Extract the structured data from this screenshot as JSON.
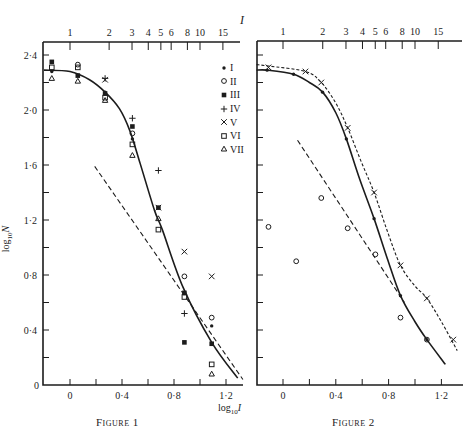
{
  "title": "I",
  "figures": [
    {
      "caption": "Figure 1",
      "ylabel_base": "log",
      "ylabel_sub": "10",
      "ylabel_var": "N"
    },
    {
      "caption": "Figure 2"
    }
  ],
  "xlabel": {
    "base": "log",
    "sub": "10",
    "var": "I"
  },
  "legend": [
    {
      "marker": "dot",
      "label": "I"
    },
    {
      "marker": "circle",
      "label": "II"
    },
    {
      "marker": "filled-square",
      "label": "III"
    },
    {
      "marker": "plus",
      "label": "IV"
    },
    {
      "marker": "cross",
      "label": "V"
    },
    {
      "marker": "open-square",
      "label": "VI"
    },
    {
      "marker": "triangle",
      "label": "VII"
    }
  ],
  "chart_data": [
    {
      "type": "scatter",
      "title": "Figure 1",
      "xlabel": "log10 I",
      "ylabel": "log10 N",
      "top_axis_label": "I",
      "xlim": [
        -0.2,
        1.33
      ],
      "ylim": [
        0,
        2.5
      ],
      "x_ticks": [
        0,
        0.2,
        0.4,
        0.6,
        0.8,
        1.0,
        1.2
      ],
      "x_tick_labels": [
        {
          "v": 0,
          "t": "0"
        },
        {
          "v": 0.4,
          "t": "0·4"
        },
        {
          "v": 0.8,
          "t": "0·8"
        },
        {
          "v": 1.2,
          "t": "1·2"
        }
      ],
      "y_ticks": [
        0.2,
        0.4,
        0.6,
        0.8,
        1.0,
        1.2,
        1.4,
        1.6,
        1.8,
        2.0,
        2.2,
        2.4
      ],
      "y_tick_labels": [
        {
          "v": 0,
          "t": "0"
        },
        {
          "v": 0.4,
          "t": "0·4"
        },
        {
          "v": 0.8,
          "t": "0·8"
        },
        {
          "v": 1.2,
          "t": "1·2"
        },
        {
          "v": 1.6,
          "t": "1·6"
        },
        {
          "v": 2.0,
          "t": "2·0"
        },
        {
          "v": 2.4,
          "t": "2·4"
        }
      ],
      "top_ticks": [
        1,
        2,
        3,
        4,
        5,
        6,
        8,
        10,
        15
      ],
      "grid": false,
      "legend_position": "upper right",
      "series": [
        {
          "name": "I",
          "marker": "dot",
          "points": [
            [
              -0.14,
              2.28
            ],
            [
              0.27,
              2.13
            ],
            [
              0.48,
              1.79
            ],
            [
              0.68,
              1.29
            ],
            [
              1.09,
              0.43
            ]
          ]
        },
        {
          "name": "II",
          "marker": "circle",
          "points": [
            [
              0.06,
              2.33
            ],
            [
              0.48,
              1.83
            ],
            [
              0.88,
              0.79
            ],
            [
              1.09,
              0.49
            ]
          ]
        },
        {
          "name": "III",
          "marker": "filled-square",
          "points": [
            [
              -0.14,
              2.35
            ],
            [
              0.06,
              2.25
            ],
            [
              0.27,
              2.12
            ],
            [
              0.48,
              1.88
            ],
            [
              0.68,
              1.29
            ],
            [
              0.88,
              0.67
            ],
            [
              0.88,
              0.31
            ],
            [
              1.09,
              0.3
            ]
          ]
        },
        {
          "name": "IV",
          "marker": "plus",
          "points": [
            [
              0.27,
              2.23
            ],
            [
              0.48,
              1.94
            ],
            [
              0.68,
              1.56
            ],
            [
              0.88,
              0.52
            ]
          ]
        },
        {
          "name": "V",
          "marker": "cross",
          "points": [
            [
              0.27,
              2.22
            ],
            [
              0.68,
              1.29
            ],
            [
              0.88,
              0.97
            ],
            [
              1.09,
              0.79
            ]
          ]
        },
        {
          "name": "VI",
          "marker": "open-square",
          "points": [
            [
              -0.14,
              2.31
            ],
            [
              0.06,
              2.31
            ],
            [
              0.27,
              2.09
            ],
            [
              0.48,
              1.75
            ],
            [
              0.68,
              1.13
            ],
            [
              0.88,
              0.64
            ],
            [
              1.09,
              0.15
            ]
          ]
        },
        {
          "name": "VII",
          "marker": "triangle",
          "points": [
            [
              -0.14,
              2.23
            ],
            [
              0.06,
              2.21
            ],
            [
              0.27,
              2.07
            ],
            [
              0.48,
              1.67
            ],
            [
              0.68,
              1.21
            ],
            [
              1.09,
              0.08
            ]
          ]
        }
      ],
      "curves": [
        {
          "name": "fitted curve",
          "style": "solid",
          "points": [
            [
              -0.2,
              2.29
            ],
            [
              0.0,
              2.28
            ],
            [
              0.15,
              2.22
            ],
            [
              0.27,
              2.13
            ],
            [
              0.38,
              2.01
            ],
            [
              0.46,
              1.85
            ],
            [
              0.54,
              1.61
            ],
            [
              0.65,
              1.27
            ],
            [
              0.71,
              1.13
            ],
            [
              0.87,
              0.71
            ],
            [
              1.09,
              0.31
            ],
            [
              1.29,
              0.05
            ]
          ]
        },
        {
          "name": "reference line",
          "style": "dashed",
          "points": [
            [
              0.19,
              1.59
            ],
            [
              1.33,
              0.04
            ]
          ]
        }
      ]
    },
    {
      "type": "scatter",
      "title": "Figure 2",
      "xlabel": "log10 I",
      "ylabel": "log10 N",
      "top_axis_label": "I",
      "xlim": [
        -0.2,
        1.36
      ],
      "ylim": [
        0,
        2.5
      ],
      "x_ticks": [
        0,
        0.2,
        0.4,
        0.6,
        0.8,
        1.0,
        1.2
      ],
      "x_tick_labels": [
        {
          "v": 0,
          "t": "0"
        },
        {
          "v": 0.4,
          "t": "0·4"
        },
        {
          "v": 0.8,
          "t": "0·8"
        },
        {
          "v": 1.2,
          "t": "1·2"
        }
      ],
      "y_ticks": [
        0.2,
        0.4,
        0.6,
        0.8,
        1.0,
        1.2,
        1.4,
        1.6,
        1.8,
        2.0,
        2.2,
        2.4
      ],
      "y_tick_labels": [],
      "top_ticks": [
        1,
        2,
        3,
        4,
        5,
        6,
        8,
        10,
        15
      ],
      "grid": false,
      "series": [
        {
          "name": "I",
          "marker": "dot",
          "points": [
            [
              -0.12,
              2.29
            ],
            [
              0.08,
              2.26
            ],
            [
              0.3,
              2.13
            ],
            [
              0.48,
              1.79
            ],
            [
              0.69,
              1.21
            ],
            [
              0.89,
              0.65
            ],
            [
              1.09,
              0.33
            ]
          ]
        },
        {
          "name": "V",
          "marker": "cross",
          "points": [
            [
              -0.11,
              2.31
            ],
            [
              0.17,
              2.28
            ],
            [
              0.29,
              2.2
            ],
            [
              0.49,
              1.87
            ],
            [
              0.69,
              1.4
            ],
            [
              0.89,
              0.87
            ],
            [
              1.09,
              0.63
            ],
            [
              1.29,
              0.33
            ]
          ]
        },
        {
          "name": "II",
          "marker": "circle",
          "points": [
            [
              -0.11,
              1.15
            ],
            [
              0.1,
              0.9
            ],
            [
              0.29,
              1.36
            ],
            [
              0.49,
              1.14
            ],
            [
              0.7,
              0.95
            ],
            [
              0.89,
              0.49
            ],
            [
              1.09,
              0.33
            ]
          ]
        }
      ],
      "curves": [
        {
          "name": "curve through I",
          "style": "solid",
          "points": [
            [
              -0.2,
              2.29
            ],
            [
              -0.12,
              2.29
            ],
            [
              0.08,
              2.26
            ],
            [
              0.2,
              2.2
            ],
            [
              0.3,
              2.13
            ],
            [
              0.4,
              1.98
            ],
            [
              0.48,
              1.79
            ],
            [
              0.58,
              1.5
            ],
            [
              0.69,
              1.21
            ],
            [
              0.79,
              0.92
            ],
            [
              0.89,
              0.65
            ],
            [
              1.0,
              0.46
            ],
            [
              1.09,
              0.33
            ],
            [
              1.23,
              0.15
            ]
          ]
        },
        {
          "name": "curve through V",
          "style": "dotted",
          "points": [
            [
              -0.2,
              2.33
            ],
            [
              -0.11,
              2.32
            ],
            [
              0.17,
              2.28
            ],
            [
              0.29,
              2.2
            ],
            [
              0.4,
              2.05
            ],
            [
              0.49,
              1.87
            ],
            [
              0.59,
              1.63
            ],
            [
              0.69,
              1.4
            ],
            [
              0.79,
              1.12
            ],
            [
              0.89,
              0.87
            ],
            [
              1.0,
              0.72
            ],
            [
              1.09,
              0.63
            ],
            [
              1.2,
              0.46
            ],
            [
              1.32,
              0.25
            ]
          ]
        },
        {
          "name": "reference line",
          "style": "dashed",
          "points": [
            [
              0.11,
              1.78
            ],
            [
              0.92,
              0.6
            ]
          ]
        }
      ]
    }
  ]
}
